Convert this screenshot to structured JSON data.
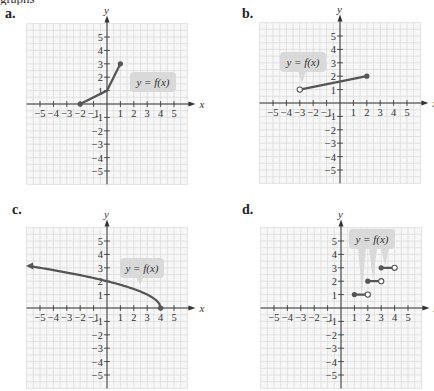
{
  "clipped_header_text": "graphs",
  "chart_data": [
    {
      "id": "a",
      "type": "line",
      "label": "a.",
      "xlabel": "x",
      "ylabel": "y",
      "xlim": [
        -5,
        5
      ],
      "ylim": [
        -5,
        5
      ],
      "x_ticks": [
        "-5",
        "-4",
        "-3",
        "-2",
        "-1",
        "1",
        "2",
        "3",
        "4",
        "5"
      ],
      "y_ticks": [
        "5",
        "4",
        "3",
        "2",
        "1",
        "-1",
        "-2",
        "-3",
        "-4",
        "-5"
      ],
      "grid": true,
      "annotation": "y = f(x)",
      "series": [
        {
          "name": "f(x)",
          "kind": "polyline",
          "points": [
            [
              -2,
              0
            ],
            [
              0,
              1
            ],
            [
              1,
              3
            ]
          ],
          "endpoints": [
            {
              "x": -2,
              "y": 0,
              "closed": true
            },
            {
              "x": 1,
              "y": 3,
              "closed": true
            }
          ]
        }
      ]
    },
    {
      "id": "b",
      "type": "line",
      "label": "b.",
      "xlabel": "x",
      "ylabel": "y",
      "xlim": [
        -5,
        5
      ],
      "ylim": [
        -5,
        5
      ],
      "x_ticks": [
        "-5",
        "-4",
        "-3",
        "-2",
        "-1",
        "1",
        "2",
        "3",
        "4",
        "5"
      ],
      "y_ticks": [
        "5",
        "4",
        "3",
        "2",
        "1",
        "-1",
        "-2",
        "-3",
        "-4",
        "-5"
      ],
      "grid": true,
      "annotation": "y = f(x)",
      "series": [
        {
          "name": "f(x)",
          "kind": "polyline",
          "points": [
            [
              -3,
              1
            ],
            [
              2,
              2
            ]
          ],
          "endpoints": [
            {
              "x": -3,
              "y": 1,
              "closed": false
            },
            {
              "x": 2,
              "y": 2,
              "closed": true
            }
          ]
        }
      ]
    },
    {
      "id": "c",
      "type": "line",
      "label": "c.",
      "xlabel": "x",
      "ylabel": "y",
      "xlim": [
        -5,
        5
      ],
      "ylim": [
        -5,
        5
      ],
      "x_ticks": [
        "-5",
        "-4",
        "-3",
        "-2",
        "-1",
        "1",
        "2",
        "3",
        "4",
        "5"
      ],
      "y_ticks": [
        "5",
        "4",
        "3",
        "2",
        "1",
        "-1",
        "-2",
        "-3",
        "-4",
        "-5"
      ],
      "grid": true,
      "annotation": "y = f(x)",
      "series": [
        {
          "name": "f(x)",
          "kind": "function",
          "formula": "sqrt(4 - x)",
          "domain": [
            -5.6,
            4
          ],
          "points": [
            [
              -5.6,
              3.1
            ],
            [
              -4,
              2.83
            ],
            [
              -2,
              2.45
            ],
            [
              0,
              2
            ],
            [
              2,
              1.41
            ],
            [
              3,
              1
            ],
            [
              4,
              0
            ]
          ],
          "arrow_left": true,
          "endpoints": [
            {
              "x": 4,
              "y": 0,
              "closed": true
            }
          ]
        }
      ]
    },
    {
      "id": "d",
      "type": "line",
      "label": "d.",
      "xlabel": "x",
      "ylabel": "y",
      "xlim": [
        -5,
        5
      ],
      "ylim": [
        -5,
        5
      ],
      "x_ticks": [
        "-5",
        "-4",
        "-3",
        "-2",
        "-1",
        "1",
        "2",
        "3",
        "4",
        "5"
      ],
      "y_ticks": [
        "5",
        "4",
        "3",
        "2",
        "1",
        "-1",
        "-2",
        "-3",
        "-4",
        "-5"
      ],
      "grid": true,
      "annotation": "y = f(x)",
      "series": [
        {
          "name": "f(x)",
          "kind": "step",
          "segments": [
            {
              "x0": 1,
              "x1": 2,
              "y": 1,
              "left_closed": true,
              "right_closed": false
            },
            {
              "x0": 2,
              "x1": 3,
              "y": 2,
              "left_closed": true,
              "right_closed": false
            },
            {
              "x0": 3,
              "x1": 4,
              "y": 3,
              "left_closed": true,
              "right_closed": false
            }
          ]
        }
      ]
    }
  ],
  "layout": {
    "panels": [
      {
        "left": 0,
        "top": 0,
        "origin": [
          107,
          104
        ],
        "unit": 13.4,
        "label_pos": [
          5,
          6
        ],
        "callout": {
          "x": 130,
          "y": 72,
          "w": 46,
          "h": 20,
          "tail_to": [
            125,
            90
          ]
        }
      },
      {
        "left": 217,
        "top": 0,
        "origin": [
          123,
          103
        ],
        "unit": 13.4,
        "label_pos": [
          25,
          6
        ],
        "callout": {
          "x": 63,
          "y": 52,
          "w": 46,
          "h": 20,
          "tail_to": [
            85,
            83
          ]
        }
      },
      {
        "left": 0,
        "top": 196,
        "origin": [
          107,
          112
        ],
        "unit": 13.4,
        "label_pos": [
          12,
          6
        ],
        "callout": {
          "x": 120,
          "y": 62,
          "w": 44,
          "h": 20,
          "tail_to": [
            140,
            88
          ]
        }
      },
      {
        "left": 217,
        "top": 196,
        "origin": [
          124,
          112
        ],
        "unit": 13.4,
        "label_pos": [
          25,
          6
        ],
        "callout": {
          "x": 132,
          "y": 33,
          "w": 46,
          "h": 20,
          "tails_to": [
            [
              145,
              97
            ],
            [
              156,
              84
            ],
            [
              168,
              70
            ]
          ]
        }
      }
    ]
  }
}
